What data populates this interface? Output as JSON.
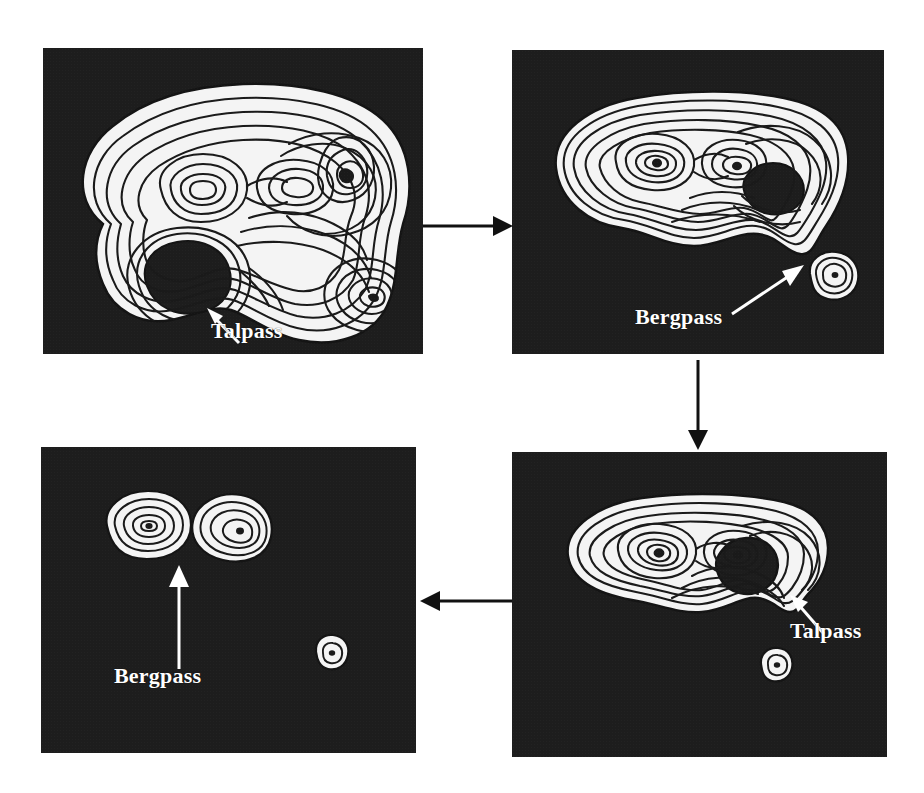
{
  "figure": {
    "type": "contour-map-sequence",
    "background_color": "#ffffff",
    "panel_fill_color": "#1d1d1d",
    "contour_line_color": "#1a1a1a",
    "contour_band_color": "#f2f2f2",
    "label_color": "#ffffff",
    "arrow_color": "#111111",
    "panel_count": 4,
    "flow_order": [
      "panel-1",
      "panel-2",
      "panel-4",
      "panel-3"
    ]
  },
  "panels": [
    {
      "id": "panel-1",
      "position": "top-left",
      "label": "Talpass",
      "label_kind": "valley-pass",
      "summits": 4,
      "description": "Full terrain at lowest threshold: one large connected contour region with four summits and an interior hole; the saddle at the lower neck is marked Talpass."
    },
    {
      "id": "panel-2",
      "position": "top-right",
      "label": "Bergpass",
      "label_kind": "mountain-pass",
      "summits": 3,
      "description": "Higher threshold: the main region has shrunk and the lower-right summit has split off as a separate small island; the saddle between them is marked Bergpass."
    },
    {
      "id": "panel-4",
      "position": "bottom-right",
      "label": "Talpass",
      "label_kind": "valley-pass",
      "summits": 3,
      "description": "Still higher threshold: the main region is an open horseshoe; the notch on its right flank is marked Talpass and the small island persists below."
    },
    {
      "id": "panel-3",
      "position": "bottom-left",
      "label": "Bergpass",
      "label_kind": "mountain-pass",
      "summits": 3,
      "description": "Highest threshold: only three small isolated summit regions remain; the gap between the two upper summits is marked Bergpass."
    }
  ],
  "arrows": [
    {
      "id": "arrow-1-2",
      "from": "panel-1",
      "to": "panel-2",
      "direction": "right"
    },
    {
      "id": "arrow-2-4",
      "from": "panel-2",
      "to": "panel-4",
      "direction": "down"
    },
    {
      "id": "arrow-4-3",
      "from": "panel-4",
      "to": "panel-3",
      "direction": "left"
    }
  ],
  "labels": {
    "talpass": "Talpass",
    "bergpass": "Bergpass"
  }
}
